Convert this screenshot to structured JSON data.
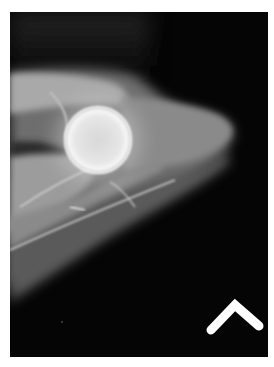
{
  "image": {
    "kind": "radiograph",
    "description": "Lateral X-ray of an elbow joint showing a rounded bright articular head with adjacent forearm bone shafts extending to lower left",
    "colors": {
      "background": "#050505",
      "margin": "#ffffff",
      "soft_tissue": "#7a7a7a",
      "bone": "#c8c8c8",
      "bone_bright": "#f2f2f2",
      "marker": "#ffffff"
    }
  },
  "marker": {
    "shape": "chevron",
    "color": "#ffffff"
  }
}
